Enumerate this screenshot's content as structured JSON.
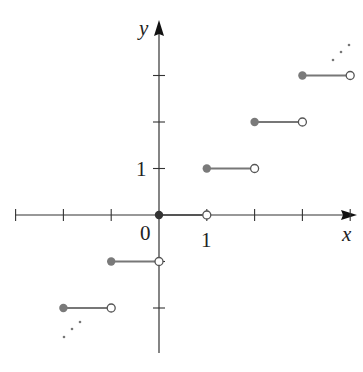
{
  "chart_data": {
    "type": "line",
    "title": "",
    "function": "floor",
    "xlabel": "x",
    "ylabel": "y",
    "origin_label": "0",
    "x_tick_labels": [
      "1"
    ],
    "y_tick_labels": [
      "1"
    ],
    "x_ticks": [
      -3,
      -2,
      -1,
      1,
      2,
      3,
      4
    ],
    "y_ticks": [
      -2,
      -1,
      1,
      2,
      3
    ],
    "xlim": [
      -3.0,
      4.1
    ],
    "ylim": [
      -3.0,
      3.6
    ],
    "grid": false,
    "legend": null,
    "segments": [
      {
        "y": -2,
        "x_start": -2,
        "x_end": -1,
        "start": "closed",
        "end": "open"
      },
      {
        "y": -1,
        "x_start": -1,
        "x_end": 0,
        "start": "closed",
        "end": "open"
      },
      {
        "y": 0,
        "x_start": 0,
        "x_end": 1,
        "start": "closed",
        "end": "open"
      },
      {
        "y": 1,
        "x_start": 1,
        "x_end": 2,
        "start": "closed",
        "end": "open"
      },
      {
        "y": 2,
        "x_start": 2,
        "x_end": 3,
        "start": "closed",
        "end": "open"
      },
      {
        "y": 3,
        "x_start": 3,
        "x_end": 4,
        "start": "closed",
        "end": "open"
      }
    ],
    "continuation_dots": [
      "upper-right",
      "lower-left"
    ]
  },
  "colors": {
    "axis": "#333333",
    "segment": "#777777",
    "closed_dot": "#7a7a7a",
    "open_dot_stroke": "#555555",
    "origin_dot": "#333333"
  },
  "labels": {
    "x_axis": "x",
    "y_axis": "y",
    "origin": "0",
    "x_one": "1",
    "y_one": "1"
  }
}
